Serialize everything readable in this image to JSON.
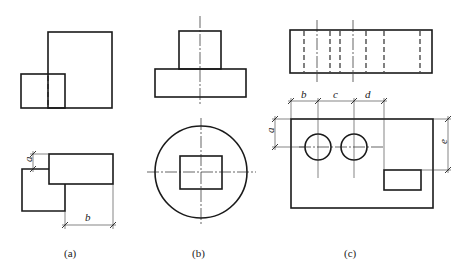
{
  "figures": [
    {
      "id": "a",
      "caption": "(a)",
      "dimensions": [
        "a",
        "b"
      ]
    },
    {
      "id": "b",
      "caption": "(b)",
      "dimensions": []
    },
    {
      "id": "c",
      "caption": "(c)",
      "dimensions": [
        "a",
        "b",
        "c",
        "d",
        "e"
      ]
    }
  ],
  "colors": {
    "line": "#1a1a1a",
    "background": "#ffffff"
  }
}
